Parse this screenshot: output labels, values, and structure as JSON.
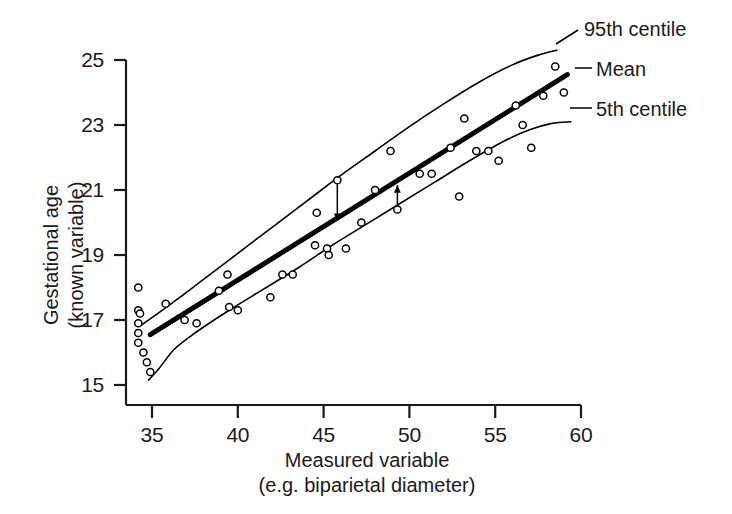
{
  "chart_data": {
    "type": "scatter",
    "title": "",
    "xlabel": "Measured variable\n(e.g. biparietal diameter)",
    "xlabel_line1": "Measured variable",
    "xlabel_line2": "(e.g. biparietal diameter)",
    "ylabel": "Gestational age\n(known variable)",
    "ylabel_line1": "Gestational age",
    "ylabel_line2": "(known variable)",
    "xlim": [
      34.0,
      60.0
    ],
    "ylim": [
      14.6,
      25.3
    ],
    "xticks": [
      35,
      40,
      45,
      50,
      55,
      60
    ],
    "yticks": [
      15,
      17,
      19,
      21,
      23,
      25
    ],
    "xtick_labels": [
      "35",
      "40",
      "45",
      "50",
      "55",
      "60"
    ],
    "ytick_labels": [
      "15",
      "17",
      "19",
      "21",
      "23",
      "25"
    ],
    "grid": false,
    "legend_position": "right-inline-annotations",
    "marker_style": "open-circle",
    "marker_color": "#000000",
    "line_color": "#000000",
    "points": [
      {
        "x": 34.2,
        "y": 18.0
      },
      {
        "x": 34.2,
        "y": 17.3
      },
      {
        "x": 34.3,
        "y": 17.2
      },
      {
        "x": 34.2,
        "y": 16.9
      },
      {
        "x": 34.2,
        "y": 16.6
      },
      {
        "x": 34.2,
        "y": 16.3
      },
      {
        "x": 34.5,
        "y": 16.0
      },
      {
        "x": 34.7,
        "y": 15.7
      },
      {
        "x": 34.9,
        "y": 15.4
      },
      {
        "x": 35.8,
        "y": 17.5
      },
      {
        "x": 36.9,
        "y": 17.0
      },
      {
        "x": 37.6,
        "y": 16.9
      },
      {
        "x": 38.9,
        "y": 17.9
      },
      {
        "x": 39.4,
        "y": 18.4
      },
      {
        "x": 39.5,
        "y": 17.4
      },
      {
        "x": 40.0,
        "y": 17.3
      },
      {
        "x": 41.9,
        "y": 17.7
      },
      {
        "x": 42.6,
        "y": 18.4
      },
      {
        "x": 43.2,
        "y": 18.4
      },
      {
        "x": 44.5,
        "y": 19.3
      },
      {
        "x": 44.6,
        "y": 20.3
      },
      {
        "x": 45.2,
        "y": 19.2
      },
      {
        "x": 45.3,
        "y": 19.0
      },
      {
        "x": 45.8,
        "y": 21.3
      },
      {
        "x": 46.3,
        "y": 19.2
      },
      {
        "x": 47.2,
        "y": 20.0
      },
      {
        "x": 48.0,
        "y": 21.0
      },
      {
        "x": 48.9,
        "y": 22.2
      },
      {
        "x": 49.3,
        "y": 20.4
      },
      {
        "x": 50.6,
        "y": 21.5
      },
      {
        "x": 51.3,
        "y": 21.5
      },
      {
        "x": 52.4,
        "y": 22.3
      },
      {
        "x": 52.9,
        "y": 20.8
      },
      {
        "x": 53.2,
        "y": 23.2
      },
      {
        "x": 53.9,
        "y": 22.2
      },
      {
        "x": 54.6,
        "y": 22.2
      },
      {
        "x": 55.2,
        "y": 21.9
      },
      {
        "x": 56.2,
        "y": 23.6
      },
      {
        "x": 56.6,
        "y": 23.0
      },
      {
        "x": 57.1,
        "y": 22.3
      },
      {
        "x": 57.8,
        "y": 23.9
      },
      {
        "x": 58.5,
        "y": 24.8
      },
      {
        "x": 59.0,
        "y": 24.0
      }
    ],
    "series": [
      {
        "name": "95th centile",
        "label": "95th centile",
        "type": "curve",
        "linewidth": "thin",
        "points": [
          {
            "x": 34.4,
            "y": 16.85
          },
          {
            "x": 35.2,
            "y": 17.15
          },
          {
            "x": 36.5,
            "y": 17.65
          },
          {
            "x": 38.0,
            "y": 18.25
          },
          {
            "x": 40.0,
            "y": 19.05
          },
          {
            "x": 42.0,
            "y": 19.85
          },
          {
            "x": 44.0,
            "y": 20.65
          },
          {
            "x": 46.0,
            "y": 21.45
          },
          {
            "x": 48.0,
            "y": 22.2
          },
          {
            "x": 50.0,
            "y": 22.95
          },
          {
            "x": 52.0,
            "y": 23.65
          },
          {
            "x": 54.0,
            "y": 24.3
          },
          {
            "x": 56.0,
            "y": 24.85
          },
          {
            "x": 57.5,
            "y": 25.15
          },
          {
            "x": 58.6,
            "y": 25.3
          }
        ]
      },
      {
        "name": "Mean",
        "label": "Mean",
        "type": "line",
        "linewidth": "thick",
        "points": [
          {
            "x": 34.9,
            "y": 16.55
          },
          {
            "x": 59.2,
            "y": 24.55
          }
        ]
      },
      {
        "name": "5th centile",
        "label": "5th centile",
        "type": "curve",
        "linewidth": "thin",
        "points": [
          {
            "x": 34.8,
            "y": 15.15
          },
          {
            "x": 35.4,
            "y": 15.5
          },
          {
            "x": 36.3,
            "y": 16.1
          },
          {
            "x": 37.5,
            "y": 16.6
          },
          {
            "x": 39.5,
            "y": 17.3
          },
          {
            "x": 41.5,
            "y": 17.95
          },
          {
            "x": 43.5,
            "y": 18.6
          },
          {
            "x": 45.5,
            "y": 19.3
          },
          {
            "x": 47.5,
            "y": 19.95
          },
          {
            "x": 49.5,
            "y": 20.6
          },
          {
            "x": 51.5,
            "y": 21.25
          },
          {
            "x": 53.5,
            "y": 21.9
          },
          {
            "x": 55.5,
            "y": 22.5
          },
          {
            "x": 57.0,
            "y": 22.85
          },
          {
            "x": 58.3,
            "y": 23.05
          },
          {
            "x": 59.4,
            "y": 23.1
          }
        ]
      }
    ],
    "annotations": [
      {
        "name": "deviation-arrow-above-mean",
        "x": 45.8,
        "y_from": 21.25,
        "y_to": 20.05,
        "direction": "down"
      },
      {
        "name": "deviation-arrow-below-mean",
        "x": 49.3,
        "y_from": 20.5,
        "y_to": 21.15,
        "direction": "up"
      }
    ]
  },
  "labels": {
    "upper_centile": "95th centile",
    "mean": "Mean",
    "lower_centile": "5th centile"
  }
}
